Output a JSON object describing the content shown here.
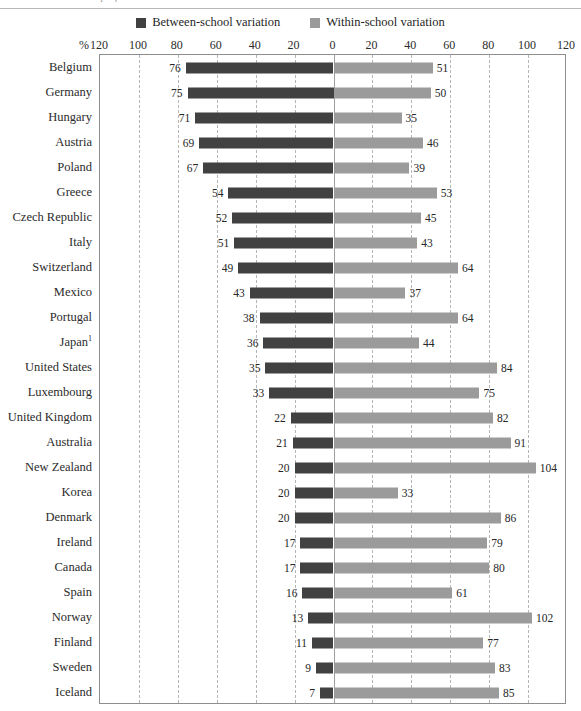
{
  "caption": {
    "partial_text": "variation in student performance between schools and within schools"
  },
  "legend": {
    "position": "top-center",
    "items": [
      {
        "label": "Between-school variation",
        "color": "#414141",
        "swatch_icon": "square-swatch"
      },
      {
        "label": "Within-school variation",
        "color": "#9b9b9b",
        "swatch_icon": "square-swatch"
      }
    ]
  },
  "axis": {
    "unit_label": "%",
    "tick_labels": [
      "120",
      "100",
      "80",
      "60",
      "40",
      "20",
      "0",
      "20",
      "40",
      "60",
      "80",
      "100",
      "120"
    ],
    "tick_values": [
      -120,
      -100,
      -80,
      -60,
      -40,
      -20,
      0,
      20,
      40,
      60,
      80,
      100,
      120
    ]
  },
  "chart_data": {
    "type": "bar",
    "title": "",
    "subtitle": "",
    "orientation": "horizontal-diverging",
    "xlabel": "%",
    "ylabel": "",
    "xlim": [
      -120,
      120
    ],
    "grid": true,
    "legend_position": "top-center",
    "categories": [
      "Belgium",
      "Germany",
      "Hungary",
      "Austria",
      "Poland",
      "Greece",
      "Czech Republic",
      "Italy",
      "Switzerland",
      "Mexico",
      "Portugal",
      "Japan¹",
      "United States",
      "Luxembourg",
      "United Kingdom",
      "Australia",
      "New Zealand",
      "Korea",
      "Denmark",
      "Ireland",
      "Canada",
      "Spain",
      "Norway",
      "Finland",
      "Sweden",
      "Iceland"
    ],
    "series": [
      {
        "name": "Between-school variation",
        "color": "#414141",
        "side": "left",
        "values": [
          76,
          75,
          71,
          69,
          67,
          54,
          52,
          51,
          49,
          43,
          38,
          36,
          35,
          33,
          22,
          21,
          20,
          20,
          20,
          17,
          17,
          16,
          13,
          11,
          9,
          7
        ]
      },
      {
        "name": "Within-school variation",
        "color": "#9b9b9b",
        "side": "right",
        "values": [
          51,
          50,
          35,
          46,
          39,
          53,
          45,
          43,
          64,
          37,
          64,
          44,
          84,
          75,
          82,
          91,
          104,
          33,
          86,
          79,
          80,
          61,
          102,
          77,
          83,
          85
        ]
      }
    ]
  },
  "colors": {
    "between_school": "#414141",
    "within_school": "#9b9b9b",
    "gridline": "#b5b5b5",
    "zero_line": "#9e9e9e",
    "frame": "#8e8e8e",
    "text": "#2b2b2b"
  }
}
